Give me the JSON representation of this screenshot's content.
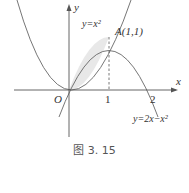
{
  "figure": {
    "caption": "图 3. 15",
    "axes": {
      "x_label": "x",
      "y_label": "y",
      "origin_label": "O",
      "x_ticks": [
        "1",
        "2"
      ]
    },
    "curves": [
      {
        "name": "parabola-up",
        "label": "y=x²"
      },
      {
        "name": "parabola-down",
        "label": "y=2x−x²"
      }
    ],
    "point": {
      "label": "A(1,1)"
    },
    "colors": {
      "stroke": "#555555",
      "fill": "#e8e8e8"
    }
  }
}
